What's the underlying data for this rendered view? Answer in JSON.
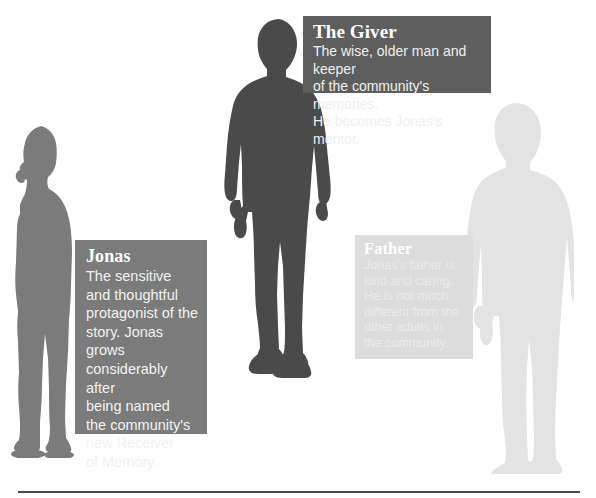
{
  "page": {
    "kind": "character-diagram",
    "subject": "The Giver"
  },
  "characters": [
    {
      "id": "jonas",
      "name": "Jonas",
      "description": "The sensitive\nand thoughtful\nprotagonist of the\nstory. Jonas grows\nconsiderably after\nbeing named\nthe community's\nnew Receiver\nof Memory.",
      "silhouette_icon": "boy-profile-silhouette-icon",
      "silhouette_color": "#7b7b7b",
      "card_color": "#7b7b7b",
      "title_color": "#ffffff",
      "body_color": "#f2f2f2"
    },
    {
      "id": "giver",
      "name": "The Giver",
      "description": "The wise, older man and keeper\nof the community's memories.\nHe becomes Jonas's mentor.",
      "silhouette_icon": "older-man-front-silhouette-icon",
      "silhouette_color": "#4a4a4a",
      "card_color": "#5e5e5e",
      "title_color": "#ffffff",
      "body_color": "#f0f0f0"
    },
    {
      "id": "father",
      "name": "Father",
      "description": "Jonas's father is\nkind and caring.\nHe is not much\ndifferent from the\nother adults in\nthe community.",
      "silhouette_icon": "man-standing-silhouette-icon",
      "silhouette_color": "#e3e3e3",
      "card_color": "#dcdcdc",
      "title_color": "#ffffff",
      "body_color": "#eaeaea"
    }
  ],
  "decorations": {
    "bottom_rule_color": "#4a4a4a",
    "background_color": "#ffffff"
  }
}
